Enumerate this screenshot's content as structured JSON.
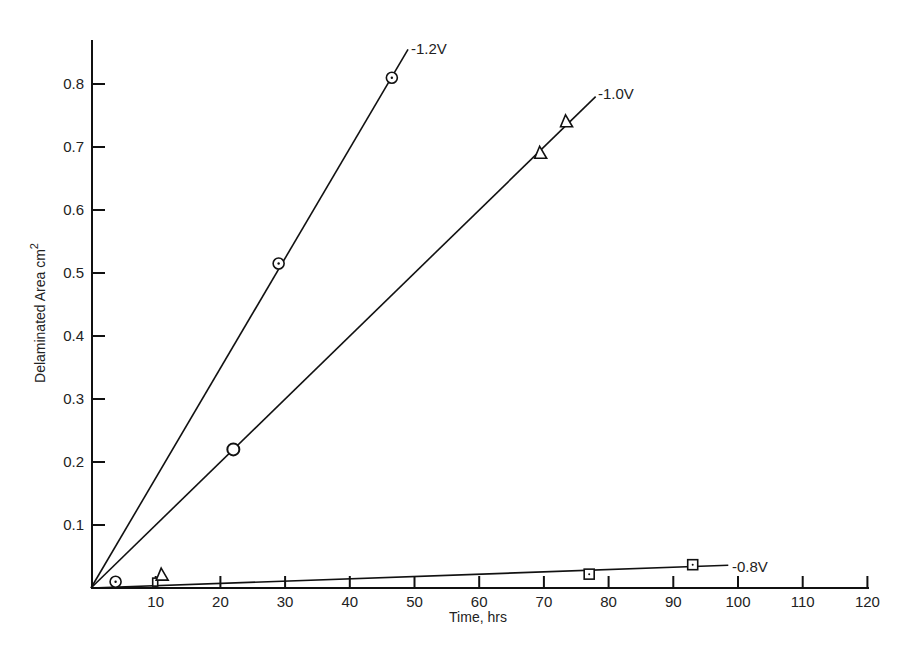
{
  "chart_data": {
    "type": "scatter",
    "title": "",
    "xlabel": "Time, hrs",
    "ylabel": "Delaminated Area cm",
    "ylabel_superscript": "2",
    "xlim": [
      0,
      120
    ],
    "ylim": [
      0,
      0.86
    ],
    "xticks": [
      10,
      20,
      30,
      40,
      50,
      60,
      70,
      80,
      90,
      100,
      110,
      120
    ],
    "yticks": [
      0.1,
      0.2,
      0.3,
      0.4,
      0.5,
      0.6,
      0.7,
      0.8
    ],
    "grid": false,
    "legend": "inline labels at line ends",
    "series": [
      {
        "name": "-1.2V",
        "marker": "circle-dot",
        "points": [
          [
            3.8,
            0.01
          ],
          [
            29,
            0.515
          ],
          [
            46.5,
            0.81
          ]
        ],
        "fit_line": [
          [
            0,
            0
          ],
          [
            49,
            0.855
          ]
        ]
      },
      {
        "name": "-1.0V",
        "marker": "circle/triangle",
        "points": [
          [
            22,
            0.22
          ],
          [
            69.5,
            0.69
          ],
          [
            73.5,
            0.74
          ]
        ],
        "fit_line": [
          [
            0,
            0
          ],
          [
            78,
            0.78
          ]
        ]
      },
      {
        "name": "-0.8V",
        "marker": "square",
        "points": [
          [
            10,
            0.003
          ],
          [
            11,
            0.022
          ],
          [
            77,
            0.022
          ],
          [
            93,
            0.037
          ]
        ],
        "fit_line": [
          [
            0,
            0
          ],
          [
            98.5,
            0.036
          ]
        ]
      }
    ]
  },
  "axes": {
    "xlabel": "Time, hrs",
    "ylabel": "Delaminated Area cm",
    "ylabel_sup": "2"
  },
  "labels": {
    "s1": "-1.2V",
    "s2": "-1.0V",
    "s3": "-0.8V"
  }
}
